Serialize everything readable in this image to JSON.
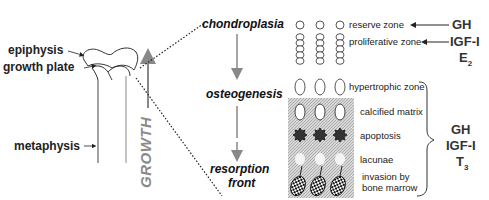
{
  "bone_labels": {
    "epiphysis": "epiphysis",
    "growth_plate": "growth plate",
    "metaphysis": "metaphysis",
    "growth": "GROWTH"
  },
  "stages": {
    "chondroplasia": "chondroplasia",
    "osteogenesis": "osteogenesis",
    "resorption_line1": "resorption",
    "resorption_line2": "front"
  },
  "zones": {
    "reserve": "reserve zone",
    "proliferative": "proliferative zone",
    "hypertrophic": "hypertrophic zone",
    "calcified": "calcified matrix",
    "apoptosis": "apoptosis",
    "lacunae": "lacunae",
    "invasion_line1": "invasion by",
    "invasion_line2": "bone marrow"
  },
  "hormones": {
    "reserve": "GH",
    "proliferative_1": "IGF-I",
    "proliferative_2": "E",
    "proliferative_2_sub": "2",
    "lower_1": "GH",
    "lower_2": "IGF-I",
    "lower_3": "T",
    "lower_3_sub": "3"
  },
  "colors": {
    "text": "#222222",
    "arrow_gray": "#888888",
    "shaded_region": "#cfcfcf",
    "hormone_text": "#333333"
  }
}
